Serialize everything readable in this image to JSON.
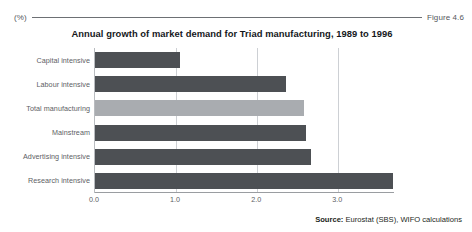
{
  "header": {
    "unit_label": "(%)",
    "figure_number": "Figure 4.6"
  },
  "source": {
    "prefix": "Source:",
    "text": " Eurostat (SBS), WIFO calculations"
  },
  "chart_data": {
    "type": "bar",
    "orientation": "horizontal",
    "title": "Annual growth of market demand for Triad manufacturing, 1989 to 1996",
    "xlabel": "",
    "ylabel": "",
    "unit": "(%)",
    "xlim": [
      0.0,
      3.7
    ],
    "xticks": [
      0.0,
      1.0,
      2.0,
      3.0
    ],
    "xticklabels": [
      "0.0",
      "1.0",
      "2.0",
      "3.0"
    ],
    "grid": true,
    "grid_axis": "x",
    "legend": false,
    "categories": [
      "Capital intensive",
      "Labour intensive",
      "Total manufacturing",
      "Mainstream",
      "Advertising intensive",
      "Research intensive"
    ],
    "values": [
      1.05,
      2.35,
      2.58,
      2.6,
      2.67,
      3.67
    ],
    "colors": [
      "#4d5054",
      "#4d5054",
      "#a9acb0",
      "#4d5054",
      "#4d5054",
      "#4d5054"
    ],
    "highlight_category": "Total manufacturing"
  }
}
